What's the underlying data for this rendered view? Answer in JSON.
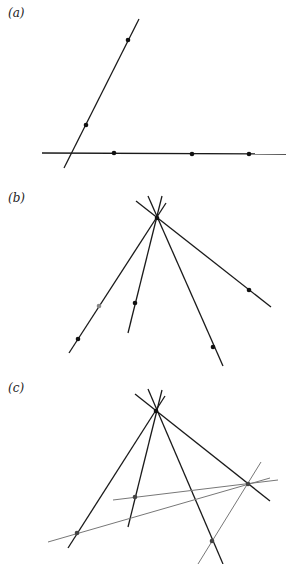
{
  "panels": [
    {
      "label": "(a)",
      "label_pos": [
        8,
        6
      ],
      "lines": [
        {
          "x1": 64,
          "y1": 168,
          "x2": 139,
          "y2": 19,
          "color": "#1a1a1a",
          "width": 1.3
        },
        {
          "x1": 42,
          "y1": 153,
          "x2": 286,
          "y2": 154,
          "color": "#1a1a1a",
          "width": 1.3
        }
      ],
      "points": [
        {
          "x": 128,
          "y": 40,
          "color": "#111"
        },
        {
          "x": 86,
          "y": 125,
          "color": "#111"
        },
        {
          "x": 114,
          "y": 153,
          "color": "#111"
        },
        {
          "x": 192,
          "y": 154,
          "color": "#111"
        },
        {
          "x": 249,
          "y": 154,
          "color": "#111"
        }
      ]
    },
    {
      "label": "(b)",
      "label_pos": [
        8,
        191
      ],
      "lines": [
        {
          "x1": 136,
          "y1": 201,
          "x2": 271,
          "y2": 307,
          "color": "#1a1a1a",
          "width": 1.3
        },
        {
          "x1": 148,
          "y1": 196,
          "x2": 223,
          "y2": 366,
          "color": "#1a1a1a",
          "width": 1.3
        },
        {
          "x1": 162,
          "y1": 196,
          "x2": 128,
          "y2": 333,
          "color": "#1a1a1a",
          "width": 1.3
        },
        {
          "x1": 166,
          "y1": 203,
          "x2": 69,
          "y2": 353,
          "color": "#1a1a1a",
          "width": 1.3
        }
      ],
      "points": [
        {
          "x": 157,
          "y": 218,
          "color": "#111"
        },
        {
          "x": 249,
          "y": 290,
          "color": "#111"
        },
        {
          "x": 213,
          "y": 347,
          "color": "#111"
        },
        {
          "x": 135,
          "y": 303,
          "color": "#111"
        },
        {
          "x": 99,
          "y": 306,
          "color": "#888"
        },
        {
          "x": 78,
          "y": 339,
          "color": "#111"
        }
      ]
    },
    {
      "label": "(c)",
      "label_pos": [
        8,
        381
      ],
      "lines": [
        {
          "x1": 135,
          "y1": 394,
          "x2": 270,
          "y2": 501,
          "color": "#1a1a1a",
          "width": 1.3
        },
        {
          "x1": 148,
          "y1": 389,
          "x2": 223,
          "y2": 564,
          "color": "#1a1a1a",
          "width": 1.3
        },
        {
          "x1": 162,
          "y1": 390,
          "x2": 128,
          "y2": 527,
          "color": "#1a1a1a",
          "width": 1.3
        },
        {
          "x1": 165,
          "y1": 396,
          "x2": 68,
          "y2": 548,
          "color": "#1a1a1a",
          "width": 1.3
        },
        {
          "x1": 113,
          "y1": 500,
          "x2": 278,
          "y2": 480,
          "color": "#777",
          "width": 1
        },
        {
          "x1": 48,
          "y1": 542,
          "x2": 270,
          "y2": 478,
          "color": "#777",
          "width": 1
        },
        {
          "x1": 261,
          "y1": 462,
          "x2": 198,
          "y2": 564,
          "color": "#777",
          "width": 1
        }
      ],
      "points": [
        {
          "x": 156,
          "y": 411,
          "color": "#111"
        },
        {
          "x": 135,
          "y": 497,
          "color": "#444"
        },
        {
          "x": 77,
          "y": 533,
          "color": "#444"
        },
        {
          "x": 248,
          "y": 484,
          "color": "#444"
        },
        {
          "x": 212,
          "y": 541,
          "color": "#444"
        }
      ]
    }
  ]
}
